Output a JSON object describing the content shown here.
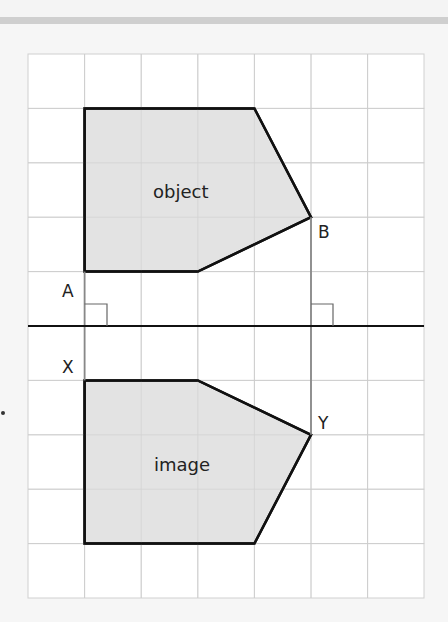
{
  "diagram": {
    "grid": {
      "columns": 7,
      "rows": 10,
      "origin_x": 28,
      "origin_y": 54,
      "cell_w": 56.6,
      "cell_h": 54.4,
      "line_color": "#d0d0d0",
      "background": "#ffffff"
    },
    "mirror_line": {
      "y_row": 5,
      "color": "#111111"
    },
    "shapes": [
      {
        "label": "object",
        "fill": "#e3e3e3",
        "stroke": "#111111",
        "points_grid": [
          [
            1,
            1
          ],
          [
            4,
            1
          ],
          [
            5,
            3
          ],
          [
            3,
            4
          ],
          [
            1,
            4
          ]
        ]
      },
      {
        "label": "image",
        "fill": "#e3e3e3",
        "stroke": "#111111",
        "points_grid": [
          [
            1,
            6
          ],
          [
            3,
            6
          ],
          [
            5,
            7
          ],
          [
            4,
            9
          ],
          [
            1,
            9
          ]
        ]
      }
    ],
    "points": [
      {
        "label": "A",
        "grid": [
          1,
          4
        ]
      },
      {
        "label": "B",
        "grid": [
          5,
          3
        ]
      },
      {
        "label": "X",
        "grid": [
          1,
          6
        ]
      },
      {
        "label": "Y",
        "grid": [
          5,
          7
        ]
      }
    ],
    "labels": {
      "object": "object",
      "image": "image",
      "A": "A",
      "B": "B",
      "X": "X",
      "Y": "Y"
    }
  }
}
